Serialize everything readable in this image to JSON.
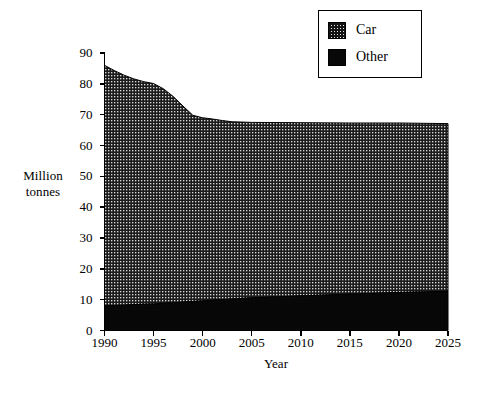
{
  "chart_data": {
    "type": "area",
    "stacked": true,
    "title": "",
    "xlabel": "Year",
    "ylabel": "Million tonnes",
    "ylabel_lines": [
      "Million",
      "tonnes"
    ],
    "xlim": [
      1990,
      2025
    ],
    "ylim": [
      0,
      90
    ],
    "grid": false,
    "legend_position": "top-right",
    "x": [
      1990,
      1991,
      1992,
      1993,
      1994,
      1995,
      1996,
      1997,
      1998,
      1999,
      2000,
      2001,
      2002,
      2003,
      2004,
      2005,
      2010,
      2015,
      2020,
      2025
    ],
    "xticks": [
      "1990",
      "1995",
      "2000",
      "2005",
      "2010",
      "2015",
      "2020",
      "2025"
    ],
    "xtick_values": [
      1990,
      1995,
      2000,
      2005,
      2010,
      2015,
      2020,
      2025
    ],
    "yticks": [
      "0",
      "10",
      "20",
      "30",
      "40",
      "50",
      "60",
      "70",
      "80",
      "90"
    ],
    "ytick_values": [
      0,
      10,
      20,
      30,
      40,
      50,
      60,
      70,
      80,
      90
    ],
    "series": [
      {
        "name": "Car",
        "fill": "stipple-dark",
        "color": "#161616",
        "values": [
          78.0,
          76.2,
          74.6,
          73.2,
          72.2,
          71.5,
          69.6,
          66.9,
          63.6,
          60.4,
          59.4,
          58.8,
          58.1,
          57.5,
          57.2,
          56.9,
          56.2,
          55.5,
          55.0,
          54.4
        ]
      },
      {
        "name": "Other",
        "fill": "solid-black",
        "color": "#070707",
        "values": [
          8.0,
          8.1,
          8.2,
          8.4,
          8.5,
          8.6,
          8.8,
          9.0,
          9.2,
          9.4,
          9.6,
          9.8,
          10.0,
          10.2,
          10.4,
          10.6,
          11.2,
          11.8,
          12.3,
          12.7
        ]
      }
    ],
    "totals": [
      86.0,
      84.3,
      82.8,
      81.6,
      80.7,
      80.1,
      78.4,
      75.9,
      72.8,
      69.8,
      69.0,
      68.6,
      68.1,
      67.7,
      67.6,
      67.5,
      67.4,
      67.3,
      67.3,
      67.1
    ]
  },
  "legend": {
    "items": [
      {
        "label": "Car"
      },
      {
        "label": "Other"
      }
    ]
  }
}
